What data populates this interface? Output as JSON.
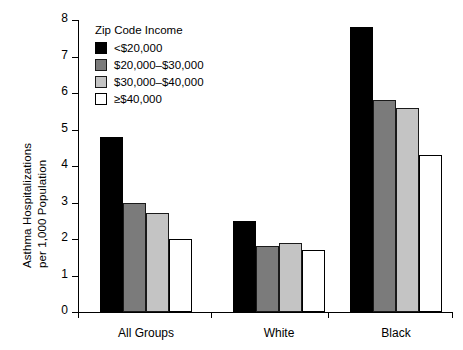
{
  "chart_data": {
    "type": "bar",
    "title": "",
    "xlabel": "",
    "ylabel": "Asthma Hospitalizations per 1,000 Population",
    "ylabel_line1": "Asthma Hospitalizations",
    "ylabel_line2": "per 1,000 Population",
    "categories": [
      "All Groups",
      "White",
      "Black"
    ],
    "ylim": [
      0,
      8
    ],
    "yticks": [
      "0",
      "1",
      "2",
      "3",
      "4",
      "5",
      "6",
      "7",
      "8"
    ],
    "grid": false,
    "legend_position": "upper-left-inside",
    "legend_title": "Zip Code Income",
    "series": [
      {
        "name": "<$20,000",
        "color": "#000000",
        "values": [
          4.8,
          2.5,
          7.8
        ]
      },
      {
        "name": "$20,000–$30,000",
        "color": "#7b7b7b",
        "values": [
          3.0,
          1.8,
          5.8
        ]
      },
      {
        "name": "$30,000–$40,000",
        "color": "#c4c4c4",
        "values": [
          2.7,
          1.9,
          5.6
        ]
      },
      {
        "name": "≥$40,000",
        "color": "#ffffff",
        "values": [
          2.0,
          1.7,
          4.3
        ]
      }
    ]
  }
}
